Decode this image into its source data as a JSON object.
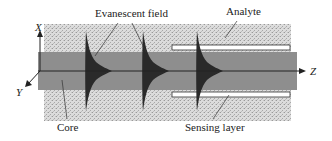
{
  "diagram": {
    "labels": {
      "evanescent_field": "Evanescent field",
      "analyte": "Analyte",
      "core": "Core",
      "sensing_layer": "Sensing layer"
    },
    "axes": {
      "x": "X",
      "y": "Y",
      "z": "Z"
    },
    "colors": {
      "cladding_stipple": "#d4d4d4",
      "core": "#8e8e8e",
      "evanescent_field": "#2a2a2a",
      "sensing_layer": "#ffffff",
      "line": "#222222"
    },
    "evanescent_field_count": 3
  }
}
